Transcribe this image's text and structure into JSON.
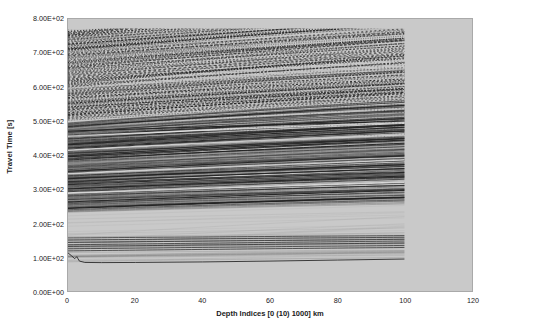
{
  "chart_data": {
    "type": "line",
    "title": "",
    "xlabel": "Depth Indices [0 (10) 1000] km",
    "ylabel": "Travel Time [s]",
    "xlim": [
      0,
      120
    ],
    "ylim": [
      0,
      800
    ],
    "grid": false,
    "legend": null,
    "xticks": [
      0,
      20,
      40,
      60,
      80,
      100,
      120
    ],
    "xtick_labels": [
      "0",
      "20",
      "40",
      "60",
      "80",
      "100",
      "120"
    ],
    "yticks": [
      0,
      100,
      200,
      300,
      400,
      500,
      600,
      700,
      800
    ],
    "ytick_labels": [
      "0.00E+00",
      "1.00E+02",
      "2.00E+02",
      "3.00E+02",
      "4.00E+02",
      "5.00E+02",
      "6.00E+02",
      "7.00E+02",
      "8.00E+02"
    ],
    "data_x_extent": [
      0,
      100
    ],
    "series": [
      {
        "name": "branch-set-upper-dashed",
        "style": "dashed",
        "time_range": [
          600,
          765
        ],
        "note": "Dense dashed/wiggle multiples band, slopes downward with depth index"
      },
      {
        "name": "branch-set-mid-dashed",
        "style": "dashed",
        "time_range": [
          500,
          600
        ],
        "note": "Second dashed multiples band"
      },
      {
        "name": "branch-set-dense-solid",
        "style": "solid",
        "time_range": [
          230,
          500
        ],
        "note": "Densely packed solid travel-time curves sloping downward"
      },
      {
        "name": "branch-set-lower-solid",
        "style": "solid",
        "time_range": [
          85,
          160
        ],
        "note": "Sparse lower branches including a kink near depth index 3 dropping from about 110 s to 85 s"
      }
    ],
    "trace_count_estimate": 101,
    "colors": {
      "plot_background": "#c9c9c9",
      "frame": "#a9a9a9",
      "trace": "#222222",
      "text": "#1a1a1a",
      "page_background": "#ffffff"
    }
  }
}
